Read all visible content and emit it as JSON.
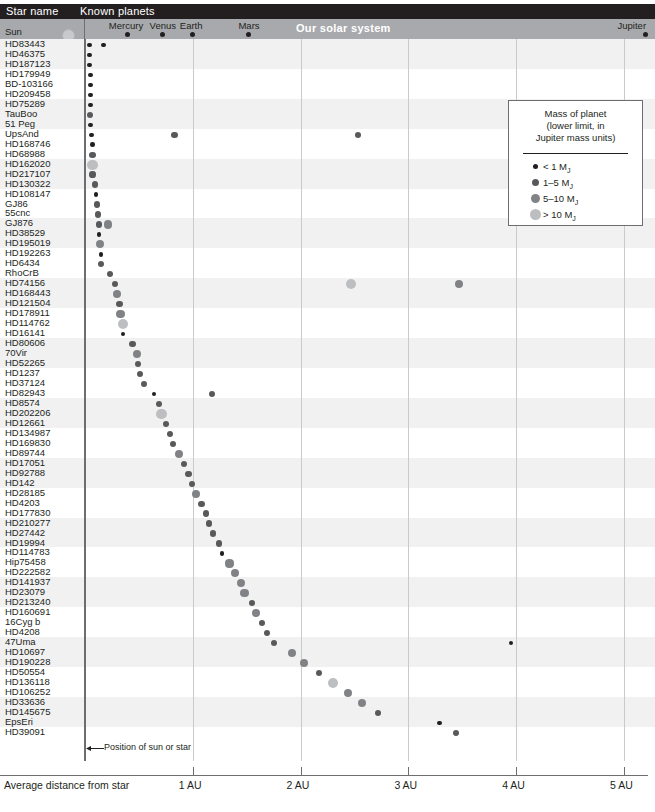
{
  "header": {
    "col_star_name": "Star name",
    "col_known_planets": "Known planets",
    "solar_system_label": "Our solar system",
    "sun_row_label": "Sun"
  },
  "solar_system_planets": [
    {
      "name": "Mercury",
      "au": 0.39
    },
    {
      "name": "Venus",
      "au": 0.72
    },
    {
      "name": "Earth",
      "au": 1.0
    },
    {
      "name": "Mars",
      "au": 1.52
    },
    {
      "name": "Jupiter",
      "au": 5.2
    }
  ],
  "legend": {
    "title_line1": "Mass of planet",
    "title_line2": "(lower limit, in",
    "title_line3": "Jupiter mass units)",
    "entries": [
      {
        "label": "< 1 M",
        "sub": "J",
        "color": "#231f20",
        "size": 5
      },
      {
        "label": "1–5 M",
        "sub": "J",
        "color": "#58595b",
        "size": 7
      },
      {
        "label": "5–10 M",
        "sub": "J",
        "color": "#808285",
        "size": 9
      },
      {
        "label": "> 10 M",
        "sub": "J",
        "color": "#bcbec0",
        "size": 11
      }
    ]
  },
  "axis": {
    "title": "Average distance from star",
    "ticks": [
      {
        "label": "1 AU",
        "au": 1
      },
      {
        "label": "2 AU",
        "au": 2
      },
      {
        "label": "3 AU",
        "au": 3
      },
      {
        "label": "4 AU",
        "au": 4
      },
      {
        "label": "5 AU",
        "au": 5
      }
    ],
    "annotation": "Position of sun or star",
    "range_au": [
      0,
      5.3
    ]
  },
  "chart_data": {
    "type": "scatter",
    "xlabel": "Average distance from star",
    "ylabel": "Star name",
    "xlim": [
      0,
      5.3
    ],
    "grid": "vertical",
    "legend_position": "right",
    "mass_classes": [
      "< 1 MJ",
      "1-5 MJ",
      "5-10 MJ",
      "> 10 MJ"
    ],
    "rows": [
      {
        "star": "HD83443",
        "planets": [
          {
            "au": 0.04,
            "m": 1
          },
          {
            "au": 0.17,
            "m": 1
          }
        ]
      },
      {
        "star": "HD46375",
        "planets": [
          {
            "au": 0.04,
            "m": 1
          }
        ]
      },
      {
        "star": "HD187123",
        "planets": [
          {
            "au": 0.04,
            "m": 1
          }
        ]
      },
      {
        "star": "HD179949",
        "planets": [
          {
            "au": 0.05,
            "m": 1
          }
        ]
      },
      {
        "star": "BD-103166",
        "planets": [
          {
            "au": 0.05,
            "m": 1
          }
        ]
      },
      {
        "star": "HD209458",
        "planets": [
          {
            "au": 0.05,
            "m": 1
          }
        ]
      },
      {
        "star": "HD75289",
        "planets": [
          {
            "au": 0.05,
            "m": 1
          }
        ]
      },
      {
        "star": "TauBoo",
        "planets": [
          {
            "au": 0.05,
            "m": 2
          }
        ]
      },
      {
        "star": "51 Peg",
        "planets": [
          {
            "au": 0.05,
            "m": 1
          }
        ]
      },
      {
        "star": "UpsAnd",
        "planets": [
          {
            "au": 0.06,
            "m": 1
          },
          {
            "au": 0.83,
            "m": 2
          },
          {
            "au": 2.53,
            "m": 2
          }
        ]
      },
      {
        "star": "HD168746",
        "planets": [
          {
            "au": 0.07,
            "m": 1
          }
        ]
      },
      {
        "star": "HD68988",
        "planets": [
          {
            "au": 0.07,
            "m": 2
          }
        ]
      },
      {
        "star": "HD162020",
        "planets": [
          {
            "au": 0.07,
            "m": 4
          }
        ]
      },
      {
        "star": "HD217107",
        "planets": [
          {
            "au": 0.07,
            "m": 2
          }
        ]
      },
      {
        "star": "HD130322",
        "planets": [
          {
            "au": 0.09,
            "m": 2
          }
        ]
      },
      {
        "star": "HD108147",
        "planets": [
          {
            "au": 0.1,
            "m": 1
          }
        ]
      },
      {
        "star": "GJ86",
        "planets": [
          {
            "au": 0.11,
            "m": 2
          }
        ]
      },
      {
        "star": "55cnc",
        "planets": [
          {
            "au": 0.12,
            "m": 2
          }
        ]
      },
      {
        "star": "GJ876",
        "planets": [
          {
            "au": 0.13,
            "m": 2
          },
          {
            "au": 0.21,
            "m": 3
          }
        ]
      },
      {
        "star": "HD38529",
        "planets": [
          {
            "au": 0.13,
            "m": 1
          }
        ]
      },
      {
        "star": "HD195019",
        "planets": [
          {
            "au": 0.14,
            "m": 3
          }
        ]
      },
      {
        "star": "HD192263",
        "planets": [
          {
            "au": 0.15,
            "m": 1
          }
        ]
      },
      {
        "star": "HD6434",
        "planets": [
          {
            "au": 0.15,
            "m": 2
          }
        ]
      },
      {
        "star": "RhoCrB",
        "planets": [
          {
            "au": 0.23,
            "m": 2
          }
        ]
      },
      {
        "star": "HD74156",
        "planets": [
          {
            "au": 0.28,
            "m": 2
          },
          {
            "au": 2.47,
            "m": 4
          },
          {
            "au": 3.47,
            "m": 3
          }
        ]
      },
      {
        "star": "HD168443",
        "planets": [
          {
            "au": 0.3,
            "m": 3
          }
        ]
      },
      {
        "star": "HD121504",
        "planets": [
          {
            "au": 0.32,
            "m": 2
          }
        ]
      },
      {
        "star": "HD178911",
        "planets": [
          {
            "au": 0.33,
            "m": 3
          }
        ]
      },
      {
        "star": "HD114762",
        "planets": [
          {
            "au": 0.35,
            "m": 4
          }
        ]
      },
      {
        "star": "HD16141",
        "planets": [
          {
            "au": 0.35,
            "m": 1
          }
        ]
      },
      {
        "star": "HD80606",
        "planets": [
          {
            "au": 0.44,
            "m": 2
          }
        ]
      },
      {
        "star": "70Vir",
        "planets": [
          {
            "au": 0.48,
            "m": 3
          }
        ]
      },
      {
        "star": "HD52265",
        "planets": [
          {
            "au": 0.49,
            "m": 2
          }
        ]
      },
      {
        "star": "HD1237",
        "planets": [
          {
            "au": 0.51,
            "m": 2
          }
        ]
      },
      {
        "star": "HD37124",
        "planets": [
          {
            "au": 0.55,
            "m": 2
          }
        ]
      },
      {
        "star": "HD82943",
        "planets": [
          {
            "au": 0.64,
            "m": 1
          },
          {
            "au": 1.18,
            "m": 2
          }
        ]
      },
      {
        "star": "HD8574",
        "planets": [
          {
            "au": 0.69,
            "m": 2
          }
        ]
      },
      {
        "star": "HD202206",
        "planets": [
          {
            "au": 0.71,
            "m": 4
          }
        ]
      },
      {
        "star": "HD12661",
        "planets": [
          {
            "au": 0.75,
            "m": 2
          }
        ]
      },
      {
        "star": "HD134987",
        "planets": [
          {
            "au": 0.79,
            "m": 2
          }
        ]
      },
      {
        "star": "HD169830",
        "planets": [
          {
            "au": 0.82,
            "m": 2
          }
        ]
      },
      {
        "star": "HD89744",
        "planets": [
          {
            "au": 0.87,
            "m": 3
          }
        ]
      },
      {
        "star": "HD17051",
        "planets": [
          {
            "au": 0.92,
            "m": 2
          }
        ]
      },
      {
        "star": "HD92788",
        "planets": [
          {
            "au": 0.96,
            "m": 2
          }
        ]
      },
      {
        "star": "HD142",
        "planets": [
          {
            "au": 0.99,
            "m": 2
          }
        ]
      },
      {
        "star": "HD28185",
        "planets": [
          {
            "au": 1.03,
            "m": 3
          }
        ]
      },
      {
        "star": "HD4203",
        "planets": [
          {
            "au": 1.08,
            "m": 2
          }
        ]
      },
      {
        "star": "HD177830",
        "planets": [
          {
            "au": 1.12,
            "m": 2
          }
        ]
      },
      {
        "star": "HD210277",
        "planets": [
          {
            "au": 1.15,
            "m": 2
          }
        ]
      },
      {
        "star": "HD27442",
        "planets": [
          {
            "au": 1.19,
            "m": 2
          }
        ]
      },
      {
        "star": "HD19994",
        "planets": [
          {
            "au": 1.24,
            "m": 2
          }
        ]
      },
      {
        "star": "HD114783",
        "planets": [
          {
            "au": 1.27,
            "m": 1
          }
        ]
      },
      {
        "star": "Hip75458",
        "planets": [
          {
            "au": 1.34,
            "m": 3
          }
        ]
      },
      {
        "star": "HD222582",
        "planets": [
          {
            "au": 1.39,
            "m": 3
          }
        ]
      },
      {
        "star": "HD141937",
        "planets": [
          {
            "au": 1.45,
            "m": 3
          }
        ]
      },
      {
        "star": "HD23079",
        "planets": [
          {
            "au": 1.48,
            "m": 3
          }
        ]
      },
      {
        "star": "HD213240",
        "planets": [
          {
            "au": 1.55,
            "m": 2
          }
        ]
      },
      {
        "star": "HD160691",
        "planets": [
          {
            "au": 1.59,
            "m": 3
          }
        ]
      },
      {
        "star": "16Cyg b",
        "planets": [
          {
            "au": 1.64,
            "m": 2
          }
        ]
      },
      {
        "star": "HD4208",
        "planets": [
          {
            "au": 1.69,
            "m": 2
          }
        ]
      },
      {
        "star": "47Uma",
        "planets": [
          {
            "au": 1.75,
            "m": 2
          },
          {
            "au": 3.95,
            "m": 1
          }
        ]
      },
      {
        "star": "HD10697",
        "planets": [
          {
            "au": 1.92,
            "m": 3
          }
        ]
      },
      {
        "star": "HD190228",
        "planets": [
          {
            "au": 2.03,
            "m": 3
          }
        ]
      },
      {
        "star": "HD50554",
        "planets": [
          {
            "au": 2.17,
            "m": 2
          }
        ]
      },
      {
        "star": "HD136118",
        "planets": [
          {
            "au": 2.3,
            "m": 4
          }
        ]
      },
      {
        "star": "HD106252",
        "planets": [
          {
            "au": 2.44,
            "m": 3
          }
        ]
      },
      {
        "star": "HD33636",
        "planets": [
          {
            "au": 2.57,
            "m": 3
          }
        ]
      },
      {
        "star": "HD145675",
        "planets": [
          {
            "au": 2.72,
            "m": 2
          }
        ]
      },
      {
        "star": "EpsEri",
        "planets": [
          {
            "au": 3.29,
            "m": 1
          }
        ]
      },
      {
        "star": "HD39091",
        "planets": [
          {
            "au": 3.44,
            "m": 2
          }
        ]
      }
    ]
  }
}
